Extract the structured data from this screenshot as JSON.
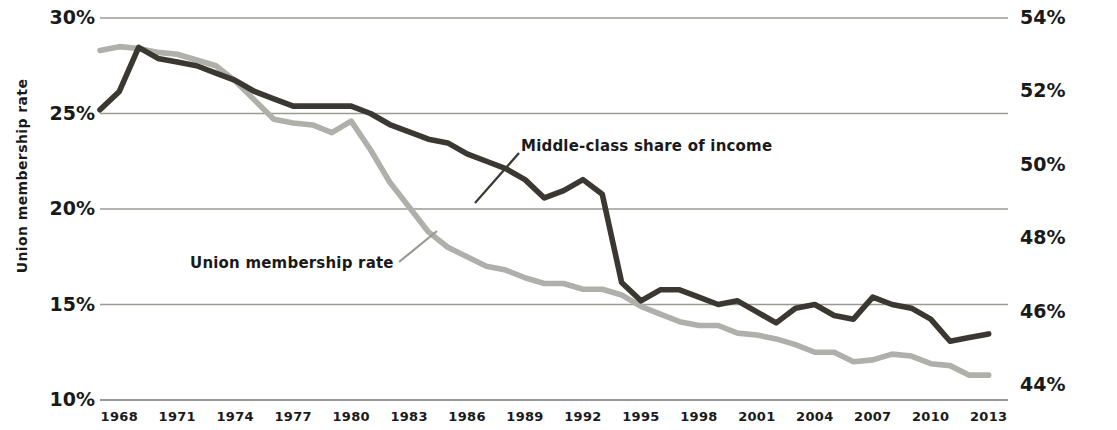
{
  "axes": {
    "left_title": "Union membership rate",
    "right_title": "Middle-class share of total income",
    "left_ticks": [
      "30%",
      "25%",
      "20%",
      "15%",
      "10%"
    ],
    "right_ticks": [
      "54%",
      "52%",
      "50%",
      "48%",
      "46%",
      "44%"
    ],
    "x_ticks": [
      "1968",
      "1971",
      "1974",
      "1977",
      "1980",
      "1983",
      "1986",
      "1989",
      "1992",
      "1995",
      "1998",
      "2001",
      "2004",
      "2007",
      "2010",
      "2013"
    ]
  },
  "annotations": {
    "middle_class": "Middle-class share of income",
    "union": "Union membership rate"
  },
  "colors": {
    "middle_class_line": "#3b3832",
    "union_line": "#b0b0aa",
    "gridline": "#9a9a94",
    "text": "#1a1a1a"
  },
  "chart_data": {
    "type": "line",
    "title": "",
    "xlabel": "",
    "ylabel": "Union membership rate",
    "y2label": "Middle-class share of total income",
    "grid": true,
    "legend": "inline-annotations",
    "xlim": [
      1967,
      2014
    ],
    "ylim": [
      10,
      30
    ],
    "y2lim": [
      43.6,
      54
    ],
    "ytick_values": [
      30,
      25,
      20,
      15,
      10
    ],
    "y2tick_values": [
      54,
      52,
      50,
      48,
      46,
      44
    ],
    "x": [
      1967,
      1968,
      1969,
      1970,
      1971,
      1972,
      1973,
      1974,
      1975,
      1976,
      1977,
      1978,
      1979,
      1980,
      1981,
      1982,
      1983,
      1984,
      1985,
      1986,
      1987,
      1988,
      1989,
      1990,
      1991,
      1992,
      1993,
      1994,
      1995,
      1996,
      1997,
      1998,
      1999,
      2000,
      2001,
      2002,
      2003,
      2004,
      2005,
      2006,
      2007,
      2008,
      2009,
      2010,
      2011,
      2012,
      2013
    ],
    "series": [
      {
        "name": "Middle-class share of income",
        "axis": "right",
        "unit": "%",
        "color": "#3b3832",
        "values": [
          51.5,
          52.0,
          53.2,
          52.9,
          52.8,
          52.7,
          52.5,
          52.3,
          52.0,
          51.8,
          51.6,
          51.6,
          51.6,
          51.6,
          51.4,
          51.1,
          50.9,
          50.7,
          50.6,
          50.3,
          50.1,
          49.9,
          49.6,
          49.1,
          49.3,
          49.6,
          49.2,
          46.8,
          46.3,
          46.6,
          46.6,
          46.4,
          46.2,
          46.3,
          46.0,
          45.7,
          46.1,
          46.2,
          45.9,
          45.8,
          46.4,
          46.2,
          46.1,
          45.8,
          45.2,
          45.3,
          45.4
        ]
      },
      {
        "name": "Union membership rate",
        "axis": "left",
        "unit": "%",
        "color": "#b0b0aa",
        "values": [
          28.3,
          28.5,
          28.4,
          28.2,
          28.1,
          27.8,
          27.5,
          26.7,
          25.7,
          24.7,
          24.5,
          24.4,
          24.0,
          24.6,
          23.1,
          21.4,
          20.1,
          18.8,
          18.0,
          17.5,
          17.0,
          16.8,
          16.4,
          16.1,
          16.1,
          15.8,
          15.8,
          15.5,
          14.9,
          14.5,
          14.1,
          13.9,
          13.9,
          13.5,
          13.4,
          13.2,
          12.9,
          12.5,
          12.5,
          12.0,
          12.1,
          12.4,
          12.3,
          11.9,
          11.8,
          11.3,
          11.3
        ]
      }
    ]
  }
}
